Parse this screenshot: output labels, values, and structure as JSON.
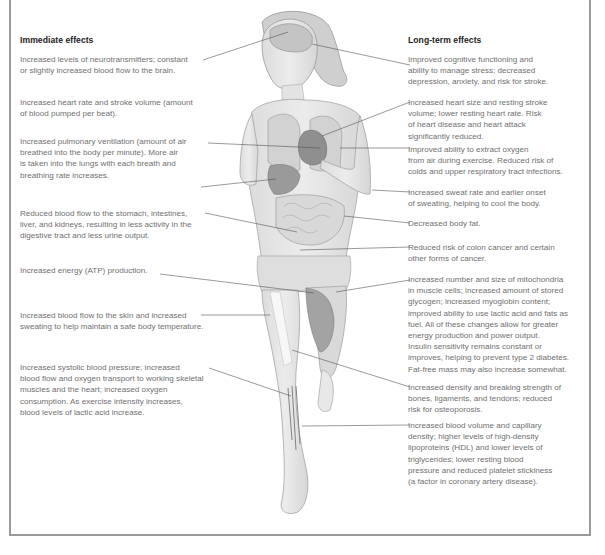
{
  "figure": {
    "left_column": {
      "title": "Immediate effects",
      "items": [
        {
          "text": "Increased levels of neurotransmitters; constant\nor slightly increased blood flow to the brain."
        },
        {
          "text": "Increased heart rate and stroke volume (amount\nof blood pumped per beat)."
        },
        {
          "text": "Increased pulmonary ventilation (amount of air\nbreathed into the body per minute). More air\nis taken into the lungs with each breath and\nbreathing rate increases."
        },
        {
          "text": "Reduced blood flow to the stomach, intestines,\nliver, and kidneys, resulting in less activity in the\ndigestive tract and less urine output."
        },
        {
          "text": "Increased energy (ATP) production."
        },
        {
          "text": "Increased blood flow to the skin and increased\nsweating to help maintain a safe body temperature."
        },
        {
          "text": "Increased systolic blood pressure; increased\nblood flow and oxygen transport to working skeletal\nmuscles and the heart; increased oxygen\nconsumption. As exercise intensity increases,\nblood levels of lactic acid increase."
        }
      ]
    },
    "right_column": {
      "title": "Long-term effects",
      "items": [
        {
          "text": "Improved cognitive functioning and\nability to manage stress; decreased\ndepression, anxiety, and risk for stroke."
        },
        {
          "text": "Increased heart size and resting stroke\nvolume; lower resting heart rate. Risk\nof heart disease and heart attack\nsignificantly reduced."
        },
        {
          "text": "Improved ability to extract oxygen\nfrom air during exercise. Reduced risk of\ncolds and upper respiratory tract infections."
        },
        {
          "text": "Increased sweat rate and earlier onset\nof sweating, helping to cool the body."
        },
        {
          "text": "Decreased body fat."
        },
        {
          "text": "Reduced risk of colon cancer and certain\nother forms of cancer."
        },
        {
          "text": "Increased number and size of mitochondria\nin muscle cells; increased amount of stored\nglycogen; increased myoglobin content;\nimproved ability to use lactic acid and fats as\nfuel. All of these changes allow for greater\nenergy production and power output.\nInsulin sensitivity remains constant or\nimproves, helping to prevent type 2 diabetes.\nFat-free mass may also increase somewhat."
        },
        {
          "text": "Increased density and breaking strength of\nbones, ligaments, and tendons; reduced\nrisk for osteoporosis."
        },
        {
          "text": "Increased blood volume and capillary\ndensity; higher levels of high-density\nlipoproteins (HDL) and lower levels of\ntriglycerides; lower resting blood\npressure and reduced platelet stickiness\n(a factor in coronary artery disease)."
        }
      ]
    },
    "colors": {
      "frame": "#9a9a9a",
      "title_text": "#222222",
      "body_text": "#6f6f6f",
      "leader_line": "#555555",
      "body_fill": "#e6e6e6",
      "organ_fill": "#8c8c8c"
    }
  }
}
